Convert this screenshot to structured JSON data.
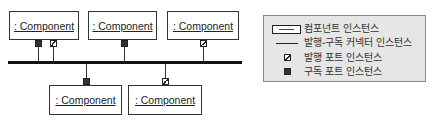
{
  "diagram": {
    "components": [
      {
        "label": ": Component",
        "position": "top-1"
      },
      {
        "label": ": Component",
        "position": "top-2"
      },
      {
        "label": ": Component",
        "position": "top-3"
      },
      {
        "label": ": Component",
        "position": "bottom-1"
      },
      {
        "label": ": Component",
        "position": "bottom-2"
      }
    ],
    "connector": "publish-subscribe bus",
    "ports": [
      {
        "component": "top-1",
        "type": "subscribe"
      },
      {
        "component": "top-1",
        "type": "publish"
      },
      {
        "component": "top-2",
        "type": "subscribe"
      },
      {
        "component": "top-3",
        "type": "publish"
      },
      {
        "component": "bottom-1",
        "type": "subscribe"
      },
      {
        "component": "bottom-2",
        "type": "publish"
      }
    ]
  },
  "legend": {
    "items": [
      {
        "icon": "component-box-icon",
        "label": "컴포넌트 인스턴스"
      },
      {
        "icon": "connector-line-icon",
        "label": "발행-구독 커넥터 인스턴스"
      },
      {
        "icon": "hatched-square-icon",
        "label": "발행 포트 인스턴스"
      },
      {
        "icon": "filled-square-icon",
        "label": "구독 포트 인스턴스"
      }
    ]
  }
}
